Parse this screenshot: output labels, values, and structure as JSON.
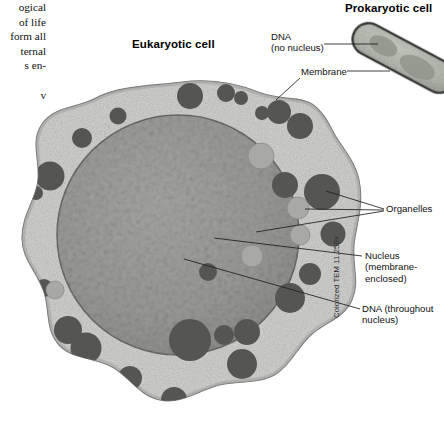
{
  "figure": {
    "headings": {
      "prokaryotic": "Prokaryotic cell",
      "eukaryotic": "Eukaryotic cell"
    },
    "callouts": {
      "dna_prokaryotic_line1": "DNA",
      "dna_prokaryotic_line2": "(no nucleus)",
      "membrane": "Membrane",
      "organelles": "Organelles",
      "nucleus_line1": "Nucleus",
      "nucleus_line2": "(membrane-",
      "nucleus_line3": "enclosed)",
      "dna_eukaryotic": "DNA (throughout nucleus)"
    },
    "credit": "Colorized TEM 11,250×",
    "colors": {
      "cytoplasm": "#d2d2d0",
      "cytoplasm_edge": "#8d8d8b",
      "nucleus": "#9a9a98",
      "nucleus_edge": "#6e6e6c",
      "organelle": "#555553",
      "organelle_light": "#9d9d9b",
      "bacterium_body": "#b9bdb4",
      "bacterium_wall": "#3c3f3a",
      "nucleoid": "#8f948a",
      "leader_line": "#1d1d1d",
      "background": "#ffffff"
    }
  },
  "body_text": {
    "lines": [
      "ogical",
      "of life",
      "form all",
      "ternal",
      "s en-"
    ],
    "trailing_line": "v"
  }
}
